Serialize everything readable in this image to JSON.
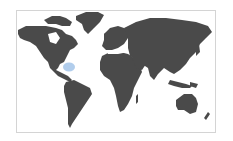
{
  "map": {
    "type": "world-map",
    "land_color": "#4a4a4a",
    "background_color": "#ffffff",
    "border_color": "#d4d4d4",
    "highlight": {
      "region": "Bahamas / Florida area",
      "color": "#a8c8ea"
    }
  }
}
